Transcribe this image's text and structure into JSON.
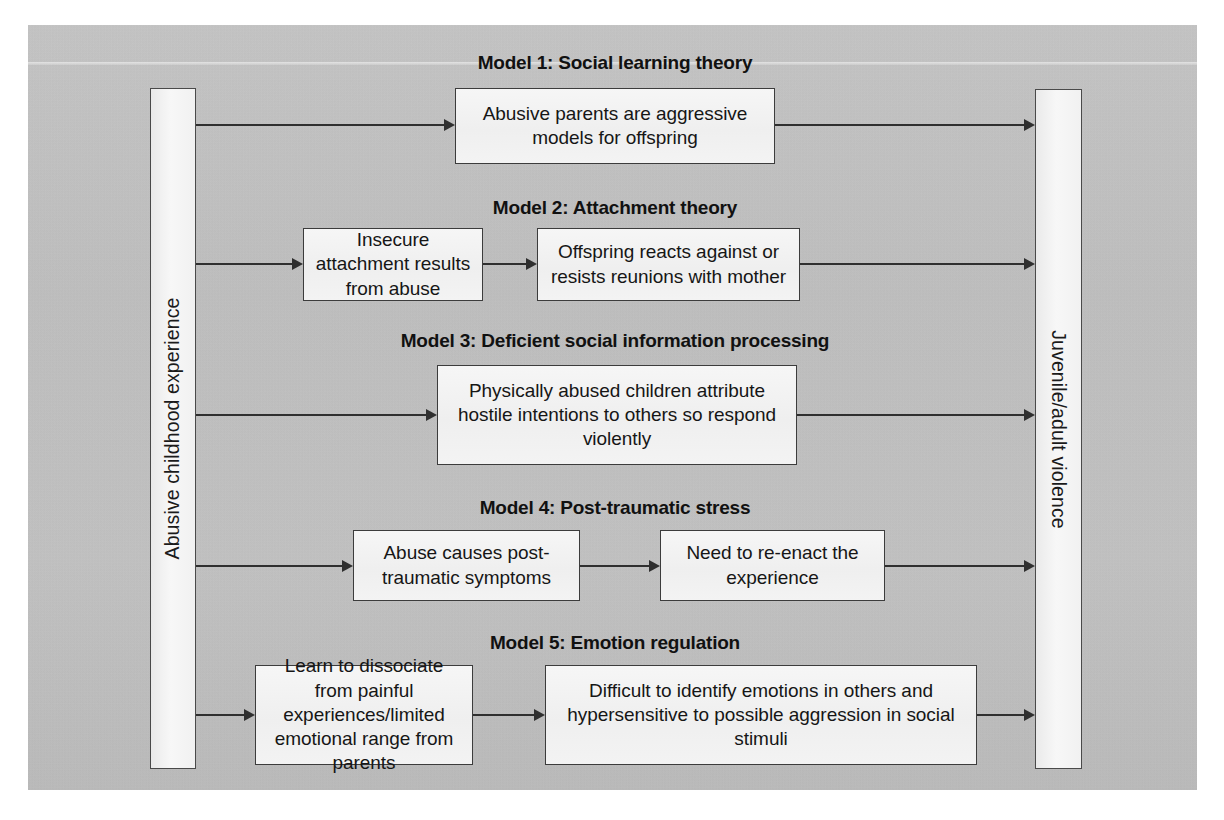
{
  "figure": {
    "left_bar_label": "Abusive childhood experience",
    "right_bar_label": "Juvenile/adult violence",
    "background_color": "#c3c3c3",
    "box_fill_color": "#f4f4f4",
    "line_color": "#2f2f2f"
  },
  "models": [
    {
      "title": "Model 1: Social learning theory",
      "steps": [
        "Abusive parents are aggressive models for offspring"
      ]
    },
    {
      "title": "Model 2: Attachment theory",
      "steps": [
        "Insecure attachment results from abuse",
        "Offspring reacts against or resists reunions with mother"
      ]
    },
    {
      "title": "Model 3: Deficient social information processing",
      "steps": [
        "Physically abused children attribute hostile intentions to others so respond violently"
      ]
    },
    {
      "title": "Model 4: Post-traumatic stress",
      "steps": [
        "Abuse causes post-traumatic symptoms",
        "Need to re-enact the experience"
      ]
    },
    {
      "title": "Model 5: Emotion regulation",
      "steps": [
        "Learn to dissociate from painful experiences/limited emotional range from parents",
        "Difficult to identify emotions in others and hypersensitive to possible aggression in social stimuli"
      ]
    }
  ]
}
